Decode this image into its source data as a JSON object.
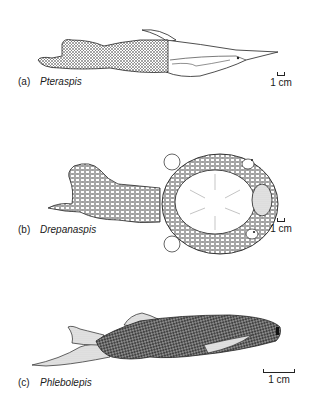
{
  "figure": {
    "panels": [
      {
        "letter": "(a)",
        "name": "Pteraspis",
        "scale_label": "1 cm"
      },
      {
        "letter": "(b)",
        "name": "Drepanaspis",
        "scale_label": "1 cm"
      },
      {
        "letter": "(c)",
        "name": "Phlebolepis",
        "scale_label": "1 cm"
      }
    ]
  }
}
